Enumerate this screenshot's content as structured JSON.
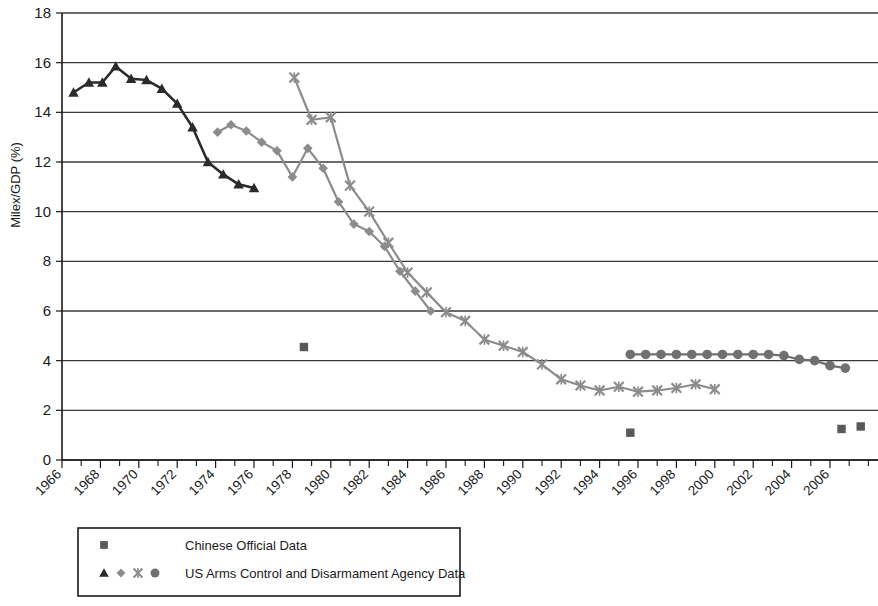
{
  "chart_data": {
    "type": "line",
    "title": "",
    "xlabel": "",
    "ylabel": "Milex/GDP (%)",
    "xlim": [
      1966,
      2008.5
    ],
    "ylim": [
      0,
      18
    ],
    "ytick_values": [
      0,
      2,
      4,
      6,
      8,
      10,
      12,
      14,
      16,
      18
    ],
    "ytick_labels": [
      "0",
      "2",
      "4",
      "6",
      "8",
      "10",
      "12",
      "14",
      "16",
      "18"
    ],
    "xtick_labels": [
      "1966",
      "1968",
      "1970",
      "1972",
      "1974",
      "1976",
      "1978",
      "1980",
      "1982",
      "1984",
      "1986",
      "1988",
      "1990",
      "1992",
      "1994",
      "1996",
      "1998",
      "2000",
      "2002",
      "2004",
      "2006"
    ],
    "xtick_values": [
      1966,
      1968,
      1970,
      1972,
      1974,
      1976,
      1978,
      1980,
      1982,
      1984,
      1986,
      1988,
      1990,
      1992,
      1994,
      1996,
      1998,
      2000,
      2002,
      2004,
      2006
    ],
    "xtick_minor_step": 1,
    "grid": "horizontal",
    "legend_position": "below-left",
    "series": [
      {
        "name": "Chinese Official Data",
        "marker": "square",
        "color": "#595959",
        "connected": false,
        "x": [
          1978.6,
          1995.6,
          2006.6,
          2007.6
        ],
        "y": [
          4.55,
          1.1,
          1.25,
          1.35
        ]
      },
      {
        "name": "US ACDA Data (triangle)",
        "marker": "triangle",
        "color": "#2b2b2b",
        "connected": true,
        "x": [
          1966.6,
          1967.4,
          1968.1,
          1968.8,
          1969.6,
          1970.4,
          1971.2,
          1972.0,
          1972.8,
          1973.6,
          1974.4,
          1975.2,
          1976.0
        ],
        "y": [
          14.8,
          15.2,
          15.2,
          15.85,
          15.35,
          15.3,
          14.95,
          14.35,
          13.4,
          12.0,
          11.5,
          11.1,
          10.95
        ]
      },
      {
        "name": "US ACDA Data (diamond)",
        "marker": "diamond",
        "color": "#8c8c8c",
        "connected": true,
        "x": [
          1974.1,
          1974.8,
          1975.6,
          1976.4,
          1977.2,
          1978.0,
          1978.8,
          1979.6,
          1980.4,
          1981.2,
          1982.0,
          1982.8,
          1983.6,
          1984.4,
          1985.2
        ],
        "y": [
          13.2,
          13.5,
          13.25,
          12.8,
          12.45,
          11.4,
          12.55,
          11.75,
          10.4,
          9.5,
          9.2,
          8.6,
          7.6,
          6.8,
          6.0
        ]
      },
      {
        "name": "US ACDA Data (x)",
        "marker": "x",
        "color": "#8c8c8c",
        "connected": true,
        "x": [
          1978.1,
          1979.0,
          1980.0,
          1981.0,
          1982.0,
          1983.0,
          1984.0,
          1985.0,
          1986.0,
          1987.0,
          1988.0,
          1989.0,
          1990.0,
          1991.0,
          1992.0,
          1993.0,
          1994.0,
          1995.0,
          1996.0,
          1997.0,
          1998.0,
          1999.0,
          2000.0
        ],
        "y": [
          15.4,
          13.7,
          13.8,
          11.05,
          10.0,
          8.75,
          7.55,
          6.75,
          5.95,
          5.6,
          4.85,
          4.6,
          4.35,
          3.85,
          3.25,
          3.0,
          2.8,
          2.95,
          2.75,
          2.8,
          2.9,
          3.05,
          2.85
        ]
      },
      {
        "name": "US ACDA Data (circle)",
        "marker": "circle",
        "color": "#707070",
        "connected": true,
        "x": [
          1995.6,
          1996.4,
          1997.2,
          1998.0,
          1998.8,
          1999.6,
          2000.4,
          2001.2,
          2002.0,
          2002.8,
          2003.6,
          2004.4,
          2005.2,
          2006.0,
          2006.8
        ],
        "y": [
          4.25,
          4.25,
          4.25,
          4.25,
          4.25,
          4.25,
          4.25,
          4.25,
          4.25,
          4.25,
          4.2,
          4.05,
          4.0,
          3.8,
          3.7
        ]
      }
    ]
  },
  "legend": {
    "rows": [
      {
        "marker": "square",
        "markers": [
          "square"
        ],
        "label": "Chinese Official Data"
      },
      {
        "marker": "mixed",
        "markers": [
          "triangle",
          "diamond",
          "x",
          "circle"
        ],
        "label": "US Arms Control and Disarmament Agency Data"
      }
    ]
  },
  "colors": {
    "triangle": "#2b2b2b",
    "diamond": "#8c8c8c",
    "x": "#8c8c8c",
    "circle": "#707070",
    "square": "#595959",
    "axis": "#1a1a1a",
    "grid": "#3a3a3a",
    "background": "#ffffff"
  }
}
